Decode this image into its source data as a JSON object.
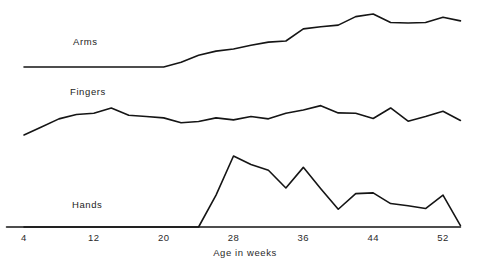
{
  "chart_data": {
    "type": "line",
    "title": "",
    "subtitle": "",
    "xlabel": "Age in weeks",
    "ylabel": "",
    "grid": false,
    "legend_position": "inline-left",
    "axis": {
      "x_ticks": [
        4,
        12,
        20,
        28,
        36,
        44,
        52
      ],
      "x_tick_labels": [
        "4",
        "12",
        "20",
        "28",
        "36",
        "44",
        "52"
      ],
      "xlim": [
        2,
        54
      ],
      "ylim": [
        0,
        1
      ],
      "x_axis_line": true,
      "y_axis_line": false
    },
    "series": [
      {
        "name": "Arms",
        "label": "Arms",
        "color": "#151515",
        "baseline_y_px": 67,
        "panel": 1,
        "x": [
          4,
          6,
          8,
          10,
          12,
          14,
          16,
          18,
          20,
          22,
          24,
          26,
          28,
          30,
          32,
          34,
          36,
          38,
          40,
          42,
          44,
          46,
          48,
          50,
          52,
          54
        ],
        "values": [
          0.0,
          0.0,
          0.0,
          0.0,
          0.0,
          0.0,
          0.0,
          0.0,
          0.0,
          0.09,
          0.22,
          0.3,
          0.34,
          0.41,
          0.47,
          0.49,
          0.72,
          0.76,
          0.79,
          0.95,
          1.0,
          0.84,
          0.83,
          0.84,
          0.94,
          0.87
        ]
      },
      {
        "name": "Fingers",
        "label": "Fingers",
        "color": "#151515",
        "baseline_y_px": 137,
        "panel": 2,
        "x": [
          4,
          6,
          8,
          10,
          12,
          14,
          16,
          18,
          20,
          22,
          24,
          26,
          28,
          30,
          32,
          34,
          36,
          38,
          40,
          42,
          44,
          46,
          48,
          50,
          52,
          54
        ],
        "values": [
          0.06,
          0.3,
          0.55,
          0.68,
          0.72,
          0.88,
          0.66,
          0.62,
          0.58,
          0.43,
          0.47,
          0.58,
          0.52,
          0.62,
          0.55,
          0.72,
          0.82,
          0.95,
          0.73,
          0.72,
          0.56,
          0.88,
          0.48,
          0.62,
          0.78,
          0.5
        ]
      },
      {
        "name": "Hands",
        "label": "Hands",
        "color": "#151515",
        "baseline_y_px": 227,
        "panel": 3,
        "x": [
          4,
          6,
          8,
          10,
          12,
          14,
          16,
          18,
          20,
          22,
          24,
          26,
          28,
          30,
          32,
          34,
          36,
          38,
          40,
          42,
          44,
          46,
          48,
          50,
          52,
          54
        ],
        "values": [
          0.0,
          0.0,
          0.0,
          0.0,
          0.0,
          0.0,
          0.0,
          0.0,
          0.0,
          0.0,
          0.0,
          0.45,
          1.0,
          0.88,
          0.8,
          0.55,
          0.84,
          0.54,
          0.25,
          0.47,
          0.48,
          0.33,
          0.3,
          0.26,
          0.45,
          0.02
        ]
      }
    ]
  },
  "labels": {
    "arms": "Arms",
    "fingers": "Fingers",
    "hands": "Hands",
    "axis_title": "Age in weeks",
    "tick_4": "4",
    "tick_12": "12",
    "tick_20": "20",
    "tick_28": "28",
    "tick_36": "36",
    "tick_44": "44",
    "tick_52": "52"
  },
  "colors": {
    "ink": "#151515",
    "text": "#2a2a2a",
    "background": "#ffffff"
  }
}
